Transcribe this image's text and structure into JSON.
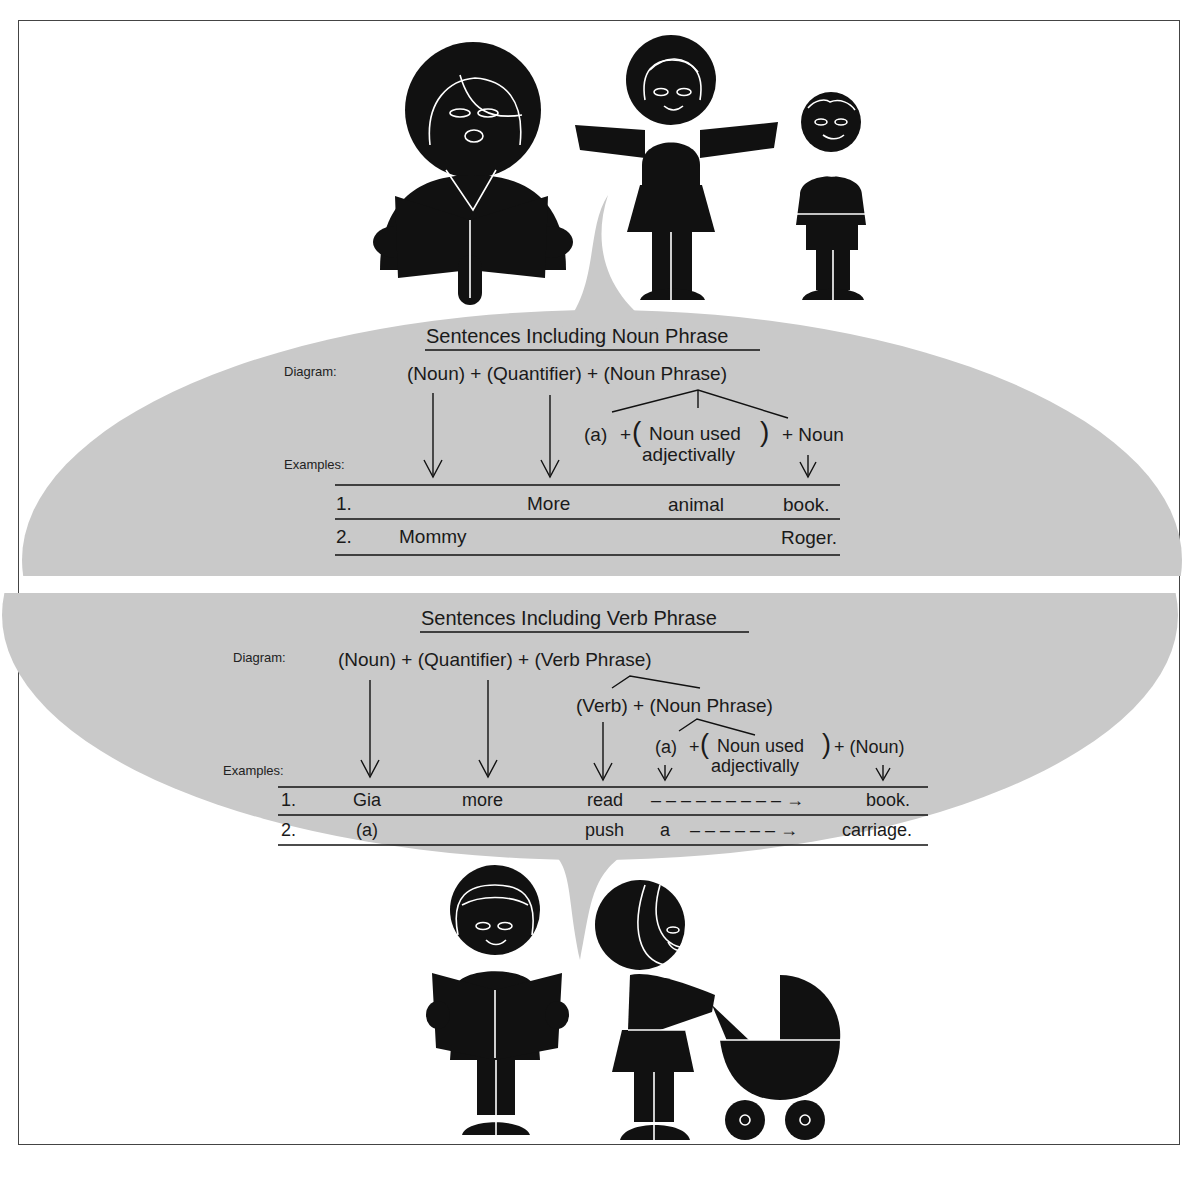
{
  "colors": {
    "bubble_gray": "#c9c9c9",
    "ink": "#111111",
    "paper": "#ffffff"
  },
  "noun_panel": {
    "title": "Sentences Including Noun Phrase",
    "diagram_label": "Diagram:",
    "examples_label": "Examples:",
    "formula": {
      "noun": "(Noun)",
      "plus1": "+",
      "quantifier": "(Quantifier)",
      "plus2": "+",
      "phrase": "(Noun Phrase)"
    },
    "expansion": {
      "article": "(a)",
      "plus1": "+",
      "adj_line1": "Noun used",
      "adj_line2": "adjectivally",
      "plus2": "+ Noun"
    },
    "rows": [
      {
        "num": "1.",
        "noun": "",
        "quantifier": "More",
        "adjective": "animal",
        "head": "book."
      },
      {
        "num": "2.",
        "noun": "Mommy",
        "quantifier": "",
        "adjective": "",
        "head": "Roger."
      }
    ]
  },
  "verb_panel": {
    "title": "Sentences Including Verb Phrase",
    "diagram_label": "Diagram:",
    "examples_label": "Examples:",
    "formula": {
      "noun": "(Noun)",
      "plus1": "+",
      "quantifier": "(Quantifier)",
      "plus2": "+",
      "phrase": "(Verb Phrase)"
    },
    "verb_expansion": "(Verb) + (Noun Phrase)",
    "np_expansion": {
      "article": "(a)",
      "plus1": "+",
      "adj_line1": "Noun used",
      "adj_line2": "adjectivally",
      "plus2": "+ (Noun)"
    },
    "rows": [
      {
        "num": "1.",
        "noun": "Gia",
        "quantifier": "more",
        "verb": "read",
        "article": "",
        "dashes": "– – – – – – – – – →",
        "head": "book."
      },
      {
        "num": "2.",
        "noun": "(a)",
        "quantifier": "",
        "verb": "push",
        "article": "a",
        "dashes": "– – – – – – →",
        "head": "carriage."
      }
    ]
  },
  "illustrations": {
    "top": [
      "woman-reading-book",
      "girl-arms-outstretched",
      "boy-standing"
    ],
    "bottom": [
      "girl-reading-book",
      "girl-pushing-pram"
    ]
  }
}
